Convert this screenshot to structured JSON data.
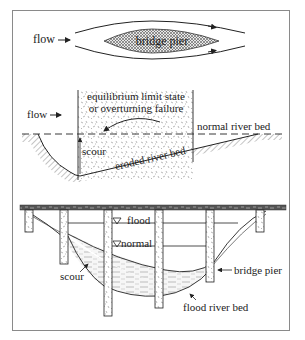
{
  "figure": {
    "panel_top": {
      "flow_label": "flow",
      "pier_label": "bridge pier"
    },
    "panel_middle": {
      "flow_label": "flow",
      "failure_label_line1": "equilibrium limit state",
      "failure_label_line2": "or overturning failure",
      "normal_bed_label": "normal river bed",
      "scour_label": "scour",
      "eroded_bed_label": "eroded river bed"
    },
    "panel_bottom": {
      "flood_label": "flood",
      "normal_label": "normal",
      "scour_label": "scour",
      "pier_label": "bridge pier",
      "flood_bed_label": "flood river bed"
    }
  },
  "colors": {
    "ink": "#222222",
    "frame": "#8a8a8a",
    "hatch": "#555555",
    "water": "#c8c8c8"
  }
}
